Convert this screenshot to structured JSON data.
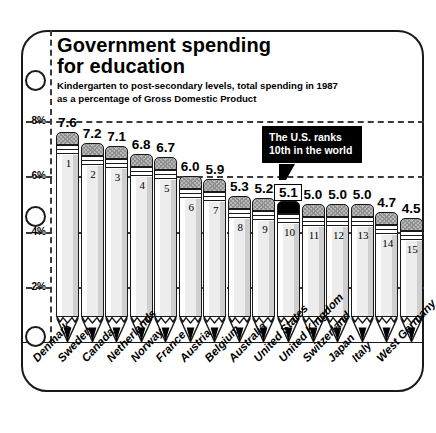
{
  "chart_data": {
    "type": "bar",
    "title": "Government  spending",
    "title_line2": "for education",
    "subtitle_line1": "Kindergarten to post-secondary levels, total spending in 1987",
    "subtitle_line2": "as a percentage of Gross Domestic Product",
    "xlabel": "",
    "ylabel": "",
    "ylim": [
      0,
      8.6
    ],
    "grid": true,
    "legend": "none",
    "ytick_labels": [
      "2%",
      "4%",
      "6%",
      "8%"
    ],
    "ytick_values": [
      2,
      4,
      6,
      8
    ],
    "categories": [
      "Denmark",
      "Sweden",
      "Canada",
      "Netherlands",
      "Norway",
      "France",
      "Austria",
      "Belgium",
      "Australia",
      "United States",
      "United Kingdom",
      "Switzerland",
      "Japan",
      "Italy",
      "West Germany"
    ],
    "values": [
      7.6,
      7.2,
      7.1,
      6.8,
      6.7,
      6.0,
      5.9,
      5.3,
      5.2,
      5.1,
      5.0,
      5.0,
      5.0,
      4.7,
      4.5
    ],
    "value_labels": [
      "7.6",
      "7.2",
      "7.1",
      "6.8",
      "6.7",
      "6.0",
      "5.9",
      "5.3",
      "5.2",
      "5.1",
      "5.0",
      "5.0",
      "5.0",
      "4.7",
      "4.5"
    ],
    "ranks": [
      "1",
      "2",
      "3",
      "4",
      "5",
      "6",
      "7",
      "8",
      "9",
      "10",
      "11",
      "12",
      "13",
      "14",
      "15"
    ],
    "highlight_index": 9,
    "annotation": {
      "line1": "The U.S. ranks",
      "line2": "10th in the world",
      "target_category": "United States"
    }
  },
  "colors": {
    "ink": "#1a1a1a",
    "callout_bg": "#000000",
    "callout_text": "#ffffff",
    "pencil_body": "#ededed",
    "eraser": "#b9b9b9",
    "highlight_eraser": "#000000"
  }
}
